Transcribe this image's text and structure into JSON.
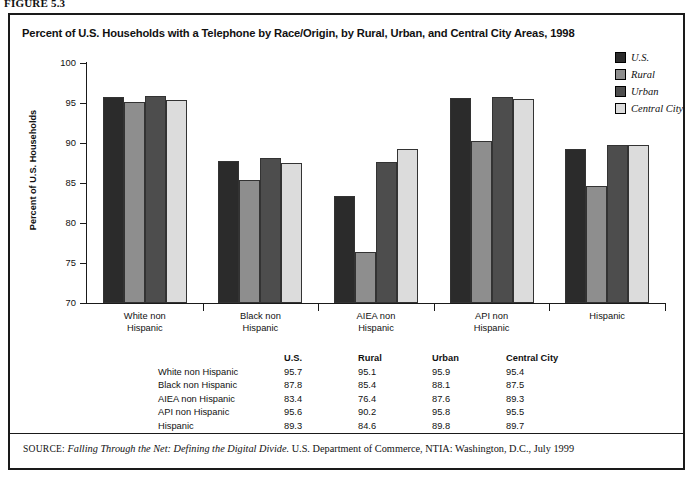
{
  "figure_label": "FIGURE 5.3",
  "chart_title": "Percent of U.S. Households with a Telephone by Race/Origin, by Rural, Urban, and Central City Areas, 1998",
  "y_axis_title": "Percent of U.S. Households",
  "legend": {
    "position": "top-right",
    "items": [
      {
        "label": "U.S.",
        "color": "#2b2b2b"
      },
      {
        "label": "Rural",
        "color": "#8e8e8e"
      },
      {
        "label": "Urban",
        "color": "#4d4d4d"
      },
      {
        "label": "Central City",
        "color": "#dcdcdc"
      }
    ]
  },
  "y_ticks": [
    "100",
    "95",
    "90",
    "85",
    "80",
    "75",
    "70"
  ],
  "table": {
    "headers": [
      "",
      "U.S.",
      "Rural",
      "Urban",
      "Central City"
    ],
    "rows": [
      {
        "label": "White non Hispanic",
        "us": "95.7",
        "rural": "95.1",
        "urban": "95.9",
        "central_city": "95.4"
      },
      {
        "label": "Black non Hispanic",
        "us": "87.8",
        "rural": "85.4",
        "urban": "88.1",
        "central_city": "87.5"
      },
      {
        "label": "AIEA non Hispanic",
        "us": "83.4",
        "rural": "76.4",
        "urban": "87.6",
        "central_city": "89.3"
      },
      {
        "label": "API non Hispanic",
        "us": "95.6",
        "rural": "90.2",
        "urban": "95.8",
        "central_city": "95.5"
      },
      {
        "label": "Hispanic",
        "us": "89.3",
        "rural": "84.6",
        "urban": "89.8",
        "central_city": "89.7"
      }
    ]
  },
  "categories_display": [
    [
      "White non",
      "Hispanic"
    ],
    [
      "Black non",
      "Hispanic"
    ],
    [
      "AIEA non",
      "Hispanic"
    ],
    [
      "API non",
      "Hispanic"
    ],
    [
      "Hispanic",
      ""
    ]
  ],
  "source": {
    "kicker": "SOURCE:",
    "title": "Falling Through the Net: Defining the Digital Divide.",
    "rest": " U.S. Department of Commerce, NTIA: Washington, D.C., July 1999"
  },
  "chart_data": {
    "type": "bar",
    "title": "Percent of U.S. Households with a Telephone by Race/Origin, by Rural, Urban, and Central City Areas, 1998",
    "xlabel": "",
    "ylabel": "Percent of U.S. Households",
    "ylim": [
      70,
      100
    ],
    "ytick_step": 5,
    "grid": false,
    "legend_position": "top-right",
    "categories": [
      "White non Hispanic",
      "Black non Hispanic",
      "AIEA non Hispanic",
      "API non Hispanic",
      "Hispanic"
    ],
    "series": [
      {
        "name": "U.S.",
        "color": "#2b2b2b",
        "values": [
          95.7,
          87.8,
          83.4,
          95.6,
          89.3
        ]
      },
      {
        "name": "Rural",
        "color": "#8e8e8e",
        "values": [
          95.1,
          85.4,
          76.4,
          90.2,
          84.6
        ]
      },
      {
        "name": "Urban",
        "color": "#4d4d4d",
        "values": [
          95.9,
          88.1,
          87.6,
          95.8,
          89.8
        ]
      },
      {
        "name": "Central City",
        "color": "#dcdcdc",
        "values": [
          95.4,
          87.5,
          89.3,
          95.5,
          89.7
        ]
      }
    ]
  }
}
